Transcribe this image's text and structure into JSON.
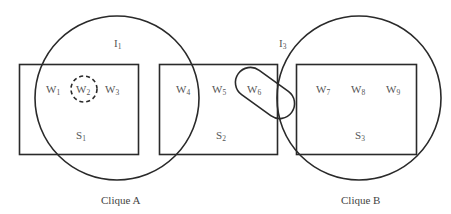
{
  "diagram": {
    "sets": [
      {
        "id": "S1",
        "label_main": "S",
        "label_sub": "1"
      },
      {
        "id": "S2",
        "label_main": "S",
        "label_sub": "2"
      },
      {
        "id": "S3",
        "label_main": "S",
        "label_sub": "3"
      }
    ],
    "nodes": [
      {
        "id": "W1",
        "main": "W",
        "sub": "1",
        "set": "S1"
      },
      {
        "id": "W2",
        "main": "W",
        "sub": "2",
        "set": "S1",
        "highlight": "dashed-circle"
      },
      {
        "id": "W3",
        "main": "W",
        "sub": "3",
        "set": "S1"
      },
      {
        "id": "W4",
        "main": "W",
        "sub": "4",
        "set": "S2"
      },
      {
        "id": "W5",
        "main": "W",
        "sub": "5",
        "set": "S2"
      },
      {
        "id": "W6",
        "main": "W",
        "sub": "6",
        "set": "S2",
        "highlight": "capsule"
      },
      {
        "id": "W7",
        "main": "W",
        "sub": "7",
        "set": "S3"
      },
      {
        "id": "W8",
        "main": "W",
        "sub": "8",
        "set": "S3"
      },
      {
        "id": "W9",
        "main": "W",
        "sub": "9",
        "set": "S3"
      }
    ],
    "interactions": [
      {
        "id": "I1",
        "main": "I",
        "sub": "1"
      },
      {
        "id": "I3",
        "main": "I",
        "sub": "3"
      }
    ],
    "captions": {
      "clique_a": "Clique A",
      "clique_b": "Clique B"
    },
    "colors": {
      "stroke": "#2a2a2a",
      "text": "#555555",
      "background": "#ffffff"
    }
  }
}
